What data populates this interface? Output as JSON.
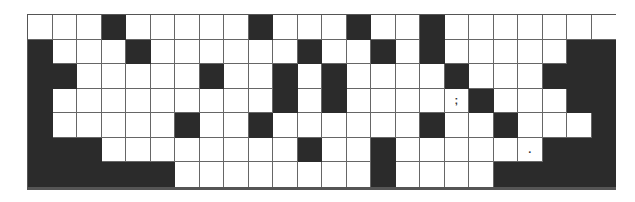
{
  "puzzle": {
    "rows": 7,
    "cols": 24,
    "colors": {
      "black": "#2b2b2b",
      "white": "#ffffff",
      "line": "#666666"
    },
    "black_cells": [
      [
        3,
        9,
        13,
        16
      ],
      [
        0,
        4,
        11,
        14,
        16,
        22,
        23
      ],
      [
        0,
        1,
        7,
        10,
        12,
        17,
        21,
        22,
        23
      ],
      [
        0,
        10,
        12,
        18,
        22,
        23
      ],
      [
        0,
        6,
        9,
        16,
        19,
        23
      ],
      [
        0,
        1,
        2,
        11,
        14,
        21,
        22,
        23
      ],
      [
        0,
        1,
        2,
        3,
        4,
        5,
        14,
        19,
        20,
        21,
        22,
        23
      ]
    ],
    "marks": [
      {
        "row": 3,
        "col": 17,
        "text": ";"
      },
      {
        "row": 5,
        "col": 20,
        "text": "."
      }
    ]
  }
}
